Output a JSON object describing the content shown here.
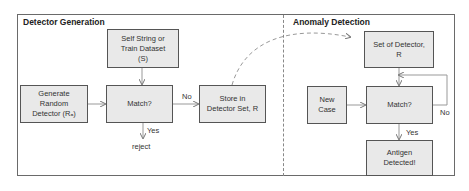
{
  "sections": {
    "left": {
      "title": "Detector Generation"
    },
    "right": {
      "title": "Anomaly Detection"
    }
  },
  "left_nodes": {
    "self_string": "Self String or\nTrain Dataset\n(S)",
    "generate": "Generate\nRandom\nDetector (Rₐ)",
    "match": "Match?",
    "store": "Store in\nDetector Set, R"
  },
  "left_labels": {
    "no": "No",
    "yes": "Yes",
    "reject": "reject"
  },
  "right_nodes": {
    "set_of_detector": "Set of Detector,\nR",
    "new_case": "New\nCase",
    "match": "Match?",
    "antigen": "Antigen\nDetected!"
  },
  "right_labels": {
    "no": "No",
    "yes": "Yes"
  },
  "colors": {
    "box_fill": "#e9e9e9",
    "box_border": "#555555",
    "arrow": "#888888"
  }
}
